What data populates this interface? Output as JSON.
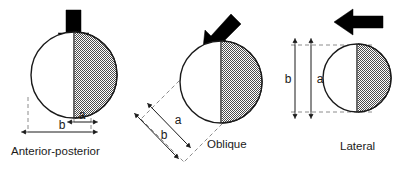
{
  "figure": {
    "background_color": "#ffffff",
    "stroke_color": "#1a1a1a",
    "dashed_color": "#8c8c8c",
    "shaded_fill": "#7d7d7d",
    "unshaded_fill": "#ffffff",
    "arrow_color": "#000000"
  },
  "panels": [
    {
      "id": "anterior-posterior",
      "caption": "Anterior-posterior",
      "load_arrow": {
        "icon": "down-arrow-icon",
        "direction": "down",
        "label": "load direction"
      },
      "circle": {
        "shading": "right-half",
        "shaded_side": "right"
      },
      "dimensions": [
        {
          "name": "a",
          "label": "a",
          "orientation": "horizontal",
          "span": "half-width"
        },
        {
          "name": "b",
          "label": "b",
          "orientation": "horizontal",
          "span": "full-width"
        }
      ]
    },
    {
      "id": "oblique",
      "caption": "Oblique",
      "load_arrow": {
        "icon": "diagonal-down-left-arrow-icon",
        "direction": "down-left",
        "label": "load direction"
      },
      "circle": {
        "shading": "right-half",
        "shaded_side": "right"
      },
      "dimensions": [
        {
          "name": "a",
          "label": "a",
          "orientation": "oblique",
          "span": "half-width"
        },
        {
          "name": "b",
          "label": "b",
          "orientation": "oblique",
          "span": "full-width"
        }
      ]
    },
    {
      "id": "lateral",
      "caption": "Lateral",
      "load_arrow": {
        "icon": "left-arrow-icon",
        "direction": "left",
        "label": "load direction"
      },
      "circle": {
        "shading": "right-half",
        "shaded_side": "right"
      },
      "dimensions": [
        {
          "name": "b",
          "label": "b",
          "orientation": "vertical",
          "span": "full-height"
        },
        {
          "name": "a",
          "label": "a",
          "orientation": "vertical",
          "span": "full-height"
        }
      ]
    }
  ]
}
